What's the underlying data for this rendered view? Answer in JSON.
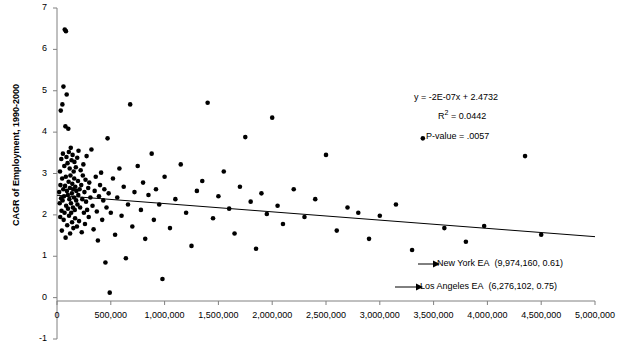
{
  "chart_data": {
    "type": "scatter",
    "title": "",
    "xlabel": "",
    "ylabel": "CAGR of Employment, 1990-2000",
    "xlim": [
      0,
      5000000
    ],
    "ylim": [
      -1,
      7
    ],
    "grid": false,
    "legend": "none",
    "xticks": [
      "0",
      "500,000",
      "1,000,000",
      "1,500,000",
      "2,000,000",
      "2,500,000",
      "3,000,000",
      "3,500,000",
      "4,000,000",
      "4,500,000",
      "5,000,000"
    ],
    "xtick_values": [
      0,
      500000,
      1000000,
      1500000,
      2000000,
      2500000,
      3000000,
      3500000,
      4000000,
      4500000,
      5000000
    ],
    "yticks": [
      "-1",
      "0",
      "1",
      "2",
      "3",
      "4",
      "5",
      "6",
      "7"
    ],
    "ytick_values": [
      -1,
      0,
      1,
      2,
      3,
      4,
      5,
      6,
      7
    ],
    "trendline": {
      "slope": -2e-07,
      "intercept": 2.4732,
      "x_start": 0,
      "x_end": 5000000
    },
    "annotations": {
      "equation": "y = -2E-07x + 2.4732",
      "r_squared_prefix": "R",
      "r_squared_sup": "2",
      "r_squared_value": " = 0.0442",
      "p_value": "P-value = .0057"
    },
    "callouts": [
      {
        "label": "New York EA",
        "coords": "(9,974,160, 0.61)",
        "point_x": 9974160,
        "point_y": 0.61
      },
      {
        "label": "Los Angeles EA",
        "coords": "(6,276,102, 0.75)",
        "point_x": 6276102,
        "point_y": 0.75
      }
    ],
    "points": [
      [
        20000,
        2.55
      ],
      [
        25000,
        2.28
      ],
      [
        28000,
        3.05
      ],
      [
        30000,
        1.95
      ],
      [
        32000,
        2.72
      ],
      [
        35000,
        4.52
      ],
      [
        38000,
        2.4
      ],
      [
        40000,
        3.35
      ],
      [
        42000,
        2.1
      ],
      [
        45000,
        1.62
      ],
      [
        48000,
        2.88
      ],
      [
        50000,
        4.67
      ],
      [
        52000,
        2.35
      ],
      [
        55000,
        3.48
      ],
      [
        58000,
        2.62
      ],
      [
        60000,
        5.1
      ],
      [
        62000,
        1.88
      ],
      [
        65000,
        2.45
      ],
      [
        68000,
        3.18
      ],
      [
        70000,
        2.05
      ],
      [
        72000,
        6.48
      ],
      [
        75000,
        2.7
      ],
      [
        78000,
        4.14
      ],
      [
        80000,
        1.45
      ],
      [
        82000,
        2.92
      ],
      [
        83000,
        6.44
      ],
      [
        85000,
        2.22
      ],
      [
        88000,
        3.4
      ],
      [
        90000,
        4.91
      ],
      [
        92000,
        2.58
      ],
      [
        95000,
        1.75
      ],
      [
        98000,
        3.25
      ],
      [
        100000,
        2.48
      ],
      [
        102000,
        2.15
      ],
      [
        105000,
        4.08
      ],
      [
        108000,
        2.8
      ],
      [
        110000,
        3.52
      ],
      [
        112000,
        1.98
      ],
      [
        115000,
        2.38
      ],
      [
        118000,
        3.12
      ],
      [
        120000,
        2.65
      ],
      [
        122000,
        1.55
      ],
      [
        125000,
        2.95
      ],
      [
        128000,
        3.62
      ],
      [
        130000,
        2.28
      ],
      [
        132000,
        2.05
      ],
      [
        135000,
        3.32
      ],
      [
        138000,
        2.52
      ],
      [
        140000,
        1.82
      ],
      [
        142000,
        2.75
      ],
      [
        145000,
        3.45
      ],
      [
        148000,
        2.18
      ],
      [
        150000,
        2.62
      ],
      [
        152000,
        1.68
      ],
      [
        155000,
        3.05
      ],
      [
        158000,
        2.42
      ],
      [
        160000,
        2.88
      ],
      [
        162000,
        3.28
      ],
      [
        165000,
        2.12
      ],
      [
        168000,
        1.92
      ],
      [
        170000,
        2.68
      ],
      [
        175000,
        3.15
      ],
      [
        178000,
        2.35
      ],
      [
        180000,
        2.58
      ],
      [
        185000,
        1.72
      ],
      [
        188000,
        3.38
      ],
      [
        190000,
        2.25
      ],
      [
        195000,
        2.82
      ],
      [
        198000,
        2.48
      ],
      [
        200000,
        3.55
      ],
      [
        205000,
        1.85
      ],
      [
        210000,
        2.62
      ],
      [
        215000,
        2.18
      ],
      [
        220000,
        3.08
      ],
      [
        225000,
        2.72
      ],
      [
        230000,
        1.58
      ],
      [
        235000,
        2.38
      ],
      [
        240000,
        2.95
      ],
      [
        245000,
        3.22
      ],
      [
        250000,
        2.05
      ],
      [
        255000,
        2.55
      ],
      [
        260000,
        1.78
      ],
      [
        265000,
        2.85
      ],
      [
        270000,
        2.32
      ],
      [
        275000,
        3.42
      ],
      [
        280000,
        2.12
      ],
      [
        290000,
        2.65
      ],
      [
        295000,
        1.95
      ],
      [
        300000,
        2.78
      ],
      [
        310000,
        2.42
      ],
      [
        320000,
        3.58
      ],
      [
        330000,
        2.22
      ],
      [
        340000,
        1.65
      ],
      [
        350000,
        2.58
      ],
      [
        360000,
        2.92
      ],
      [
        370000,
        2.08
      ],
      [
        380000,
        1.38
      ],
      [
        390000,
        2.45
      ],
      [
        400000,
        2.72
      ],
      [
        410000,
        3.02
      ],
      [
        420000,
        1.88
      ],
      [
        430000,
        2.35
      ],
      [
        440000,
        2.62
      ],
      [
        450000,
        0.85
      ],
      [
        460000,
        2.18
      ],
      [
        470000,
        3.85
      ],
      [
        480000,
        2.52
      ],
      [
        490000,
        0.12
      ],
      [
        500000,
        2.05
      ],
      [
        520000,
        2.88
      ],
      [
        540000,
        1.52
      ],
      [
        560000,
        2.42
      ],
      [
        580000,
        3.12
      ],
      [
        600000,
        1.98
      ],
      [
        620000,
        2.68
      ],
      [
        640000,
        0.95
      ],
      [
        660000,
        2.25
      ],
      [
        680000,
        4.67
      ],
      [
        700000,
        1.72
      ],
      [
        720000,
        2.55
      ],
      [
        750000,
        3.18
      ],
      [
        780000,
        2.12
      ],
      [
        800000,
        2.78
      ],
      [
        820000,
        1.42
      ],
      [
        850000,
        2.48
      ],
      [
        880000,
        3.48
      ],
      [
        900000,
        1.88
      ],
      [
        920000,
        2.62
      ],
      [
        950000,
        2.25
      ],
      [
        980000,
        0.45
      ],
      [
        1000000,
        2.92
      ],
      [
        1050000,
        1.68
      ],
      [
        1100000,
        2.38
      ],
      [
        1150000,
        3.22
      ],
      [
        1200000,
        2.05
      ],
      [
        1250000,
        1.25
      ],
      [
        1300000,
        2.58
      ],
      [
        1350000,
        2.82
      ],
      [
        1400000,
        4.71
      ],
      [
        1450000,
        1.92
      ],
      [
        1500000,
        2.45
      ],
      [
        1550000,
        3.05
      ],
      [
        1600000,
        2.15
      ],
      [
        1650000,
        1.55
      ],
      [
        1700000,
        2.68
      ],
      [
        1750000,
        3.88
      ],
      [
        1800000,
        2.32
      ],
      [
        1850000,
        1.18
      ],
      [
        1900000,
        2.52
      ],
      [
        1950000,
        2.02
      ],
      [
        2000000,
        4.35
      ],
      [
        2050000,
        2.22
      ],
      [
        2100000,
        1.78
      ],
      [
        2200000,
        2.62
      ],
      [
        2300000,
        1.95
      ],
      [
        2400000,
        2.38
      ],
      [
        2500000,
        3.45
      ],
      [
        2600000,
        1.62
      ],
      [
        2700000,
        2.18
      ],
      [
        2800000,
        2.05
      ],
      [
        2900000,
        1.42
      ],
      [
        3000000,
        1.98
      ],
      [
        3150000,
        2.25
      ],
      [
        3300000,
        1.15
      ],
      [
        3400000,
        3.85
      ],
      [
        3600000,
        1.68
      ],
      [
        3800000,
        1.35
      ],
      [
        3970000,
        1.73
      ],
      [
        4350000,
        3.42
      ],
      [
        4500000,
        1.52
      ]
    ]
  }
}
